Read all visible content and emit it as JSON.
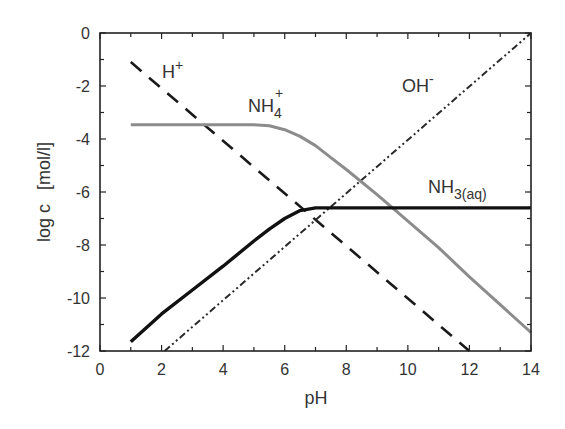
{
  "chart_data": {
    "type": "line",
    "title": "",
    "xlabel": "pH",
    "ylabel": "log c",
    "ylabel_unit": "[mol/l]",
    "xlim": [
      0,
      14
    ],
    "ylim": [
      -12,
      0
    ],
    "xticks": [
      0,
      2,
      4,
      6,
      8,
      10,
      12,
      14
    ],
    "yticks": [
      0,
      -2,
      -4,
      -6,
      -8,
      -10,
      -12
    ],
    "grid": false,
    "legend": "inline labels",
    "series": [
      {
        "name": "H+",
        "label_main": "H",
        "label_sup": "+",
        "style": "dashed",
        "color": "#1a1a1a",
        "x": [
          1,
          12
        ],
        "y": [
          -1.1,
          -12
        ]
      },
      {
        "name": "OH-",
        "label_main": "OH",
        "label_sup": "-",
        "style": "dash-dot-dot",
        "color": "#2a2a2a",
        "x": [
          2.1,
          14
        ],
        "y": [
          -12,
          0
        ]
      },
      {
        "name": "NH4+",
        "label_main": "NH",
        "label_sub": "4",
        "label_sup": "+",
        "style": "solid-gray",
        "color": "#8a8a8a",
        "x": [
          1,
          2,
          3,
          4,
          5,
          5.5,
          6,
          6.5,
          7,
          7.5,
          8,
          9,
          10,
          11,
          12,
          13,
          14
        ],
        "y": [
          -3.46,
          -3.46,
          -3.46,
          -3.46,
          -3.46,
          -3.5,
          -3.65,
          -3.9,
          -4.25,
          -4.7,
          -5.15,
          -6.1,
          -7.1,
          -8.1,
          -9.2,
          -10.25,
          -11.3
        ]
      },
      {
        "name": "NH3(aq)",
        "label_main": "NH",
        "label_sub": "3(aq)",
        "style": "solid-thick",
        "color": "#111111",
        "x": [
          1,
          2,
          3,
          4,
          5,
          5.5,
          6,
          6.5,
          7,
          8,
          10,
          12,
          14
        ],
        "y": [
          -11.65,
          -10.6,
          -9.7,
          -8.8,
          -7.85,
          -7.4,
          -7.0,
          -6.7,
          -6.6,
          -6.6,
          -6.6,
          -6.6,
          -6.6
        ]
      }
    ]
  }
}
